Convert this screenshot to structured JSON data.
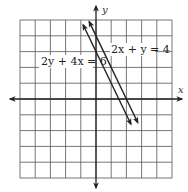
{
  "chart_data": {
    "type": "line",
    "title": "",
    "xlabel": "x",
    "ylabel": "y",
    "xlim": [
      -5,
      5
    ],
    "ylim": [
      -5,
      5
    ],
    "grid": true,
    "tick_labels": false,
    "series": [
      {
        "name": "2y + 4x = 6",
        "equation": "y = 3 - 2x",
        "slope": -2,
        "intercept": 3,
        "x": [
          -0.85,
          2.3
        ],
        "y": [
          4.7,
          -1.6
        ],
        "label_pos": [
          -3.5,
          2.3
        ]
      },
      {
        "name": "2x + y = 4",
        "equation": "y = 4 - 2x",
        "slope": -2,
        "intercept": 4,
        "x": [
          -0.45,
          2.75
        ],
        "y": [
          4.9,
          -1.5
        ],
        "label_pos": [
          0.95,
          2.9
        ]
      }
    ],
    "annotations": [
      "2y + 4x = 6",
      "2x + y = 4"
    ]
  },
  "layout": {
    "origin_px": [
      96,
      99
    ],
    "unit_x_px": 15.2,
    "unit_y_px": 15.8,
    "grid_cells": 10
  },
  "axes": {
    "x_label": "x",
    "y_label": "y"
  },
  "labels": {
    "line1": "2y + 4x = 6",
    "line2": "2x + y = 4"
  }
}
